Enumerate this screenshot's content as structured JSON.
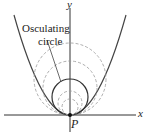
{
  "labels": {
    "y_axis": "y",
    "x_axis": "x",
    "point": "P",
    "annotation_line1": "Osculating",
    "annotation_line2": "circle"
  },
  "colors": {
    "stroke": "#333333",
    "dashed": "#888888"
  }
}
